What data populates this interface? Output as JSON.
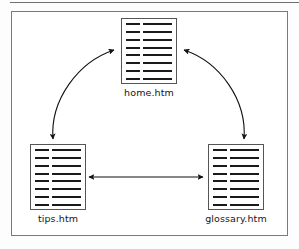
{
  "diagram": {
    "type": "site-structure-diagram",
    "background_color": "#ffffff",
    "border_color": "#7a7a7a",
    "line_color": "#1a1a1a",
    "nodes": [
      {
        "id": "home",
        "label": "home.htm",
        "icon": "document-icon",
        "position": "top-center",
        "line_rows": 8
      },
      {
        "id": "tips",
        "label": "tips.htm",
        "icon": "document-icon",
        "position": "bottom-left",
        "line_rows": 8
      },
      {
        "id": "glossary",
        "label": "glossary.htm",
        "icon": "document-icon",
        "position": "bottom-right",
        "line_rows": 8
      }
    ],
    "connectors": [
      {
        "id": "home-tips",
        "from": "home",
        "to": "tips",
        "style": "curved",
        "direction": "bidirectional"
      },
      {
        "id": "home-glossary",
        "from": "home",
        "to": "glossary",
        "style": "curved",
        "direction": "bidirectional"
      },
      {
        "id": "tips-glossary",
        "from": "tips",
        "to": "glossary",
        "style": "straight",
        "direction": "bidirectional"
      }
    ]
  }
}
